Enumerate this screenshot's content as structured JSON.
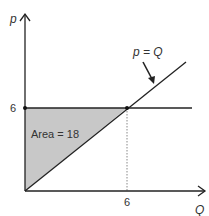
{
  "diagram": {
    "y_axis_label": "p",
    "x_axis_label": "Q",
    "y_tick": "6",
    "x_tick": "6",
    "curve_label": "p = Q",
    "area_label": "Area = 18",
    "colors": {
      "line": "#222222",
      "shade": "#c8c8c8",
      "dotted": "#888888"
    }
  }
}
